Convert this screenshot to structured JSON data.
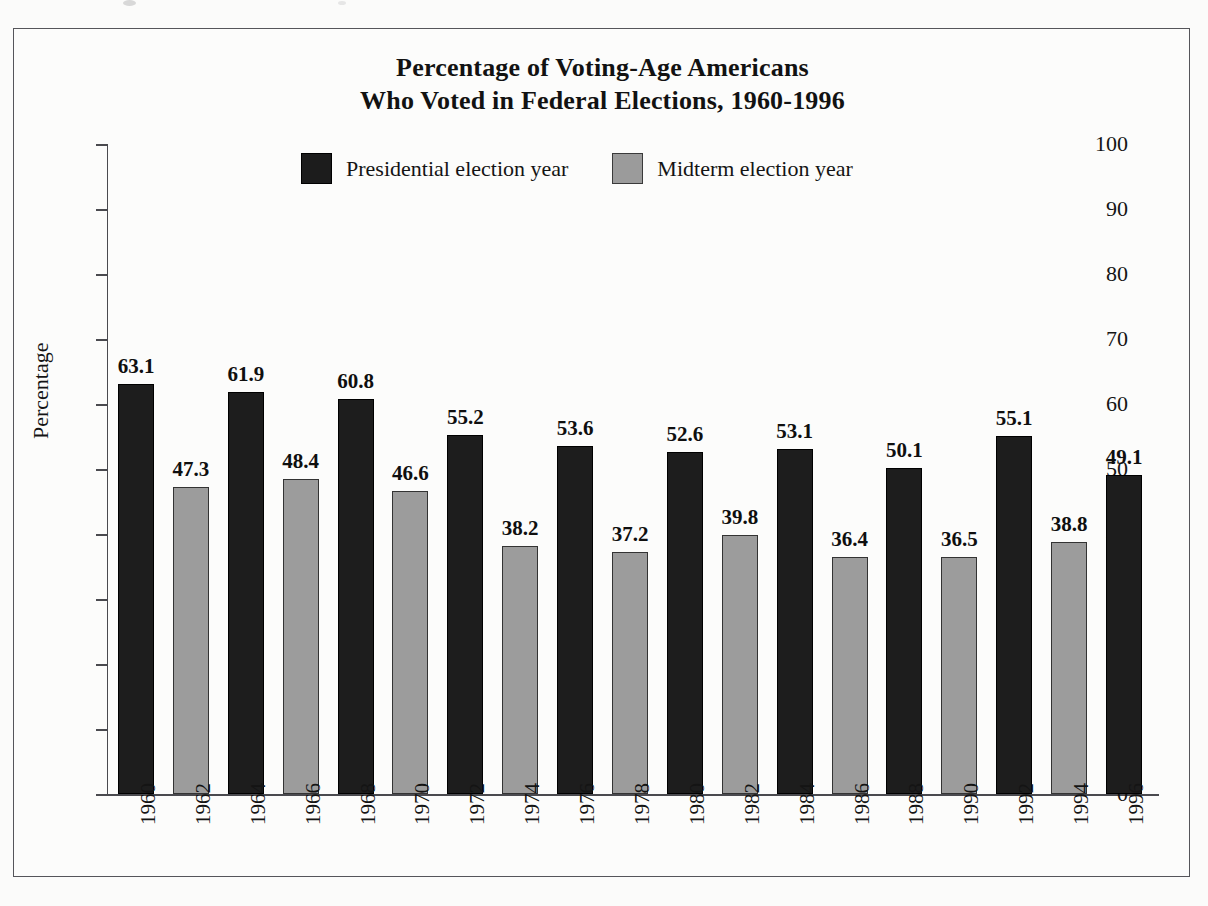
{
  "chart_data": {
    "type": "bar",
    "title": "Percentage of Voting-Age Americans Who Voted in Federal Elections, 1960-1996",
    "title_lines": [
      "Percentage of Voting-Age Americans",
      "Who Voted in Federal Elections, 1960-1996"
    ],
    "xlabel": "",
    "ylabel": "Percentage",
    "ylim": [
      0,
      100
    ],
    "ytick_step": 10,
    "grid": false,
    "legend_position": "top-center",
    "categories": [
      "1960",
      "1962",
      "1964",
      "1966",
      "1968",
      "1970",
      "1972",
      "1974",
      "1976",
      "1978",
      "1980",
      "1982",
      "1984",
      "1986",
      "1988",
      "1990",
      "1992",
      "1994",
      "1996"
    ],
    "values": [
      63.1,
      47.3,
      61.9,
      48.4,
      60.8,
      46.6,
      55.2,
      38.2,
      53.6,
      37.2,
      52.6,
      39.8,
      53.1,
      36.4,
      50.1,
      36.5,
      55.1,
      38.8,
      49.1
    ],
    "value_labels": [
      "63.1",
      "47.3",
      "61.9",
      "48.4",
      "60.8",
      "46.6",
      "55.2",
      "38.2",
      "53.6",
      "37.2",
      "52.6",
      "39.8",
      "53.1",
      "36.4",
      "50.1",
      "36.5",
      "55.1",
      "38.8",
      "49.1"
    ],
    "bar_series": [
      "presidential",
      "midterm",
      "presidential",
      "midterm",
      "presidential",
      "midterm",
      "presidential",
      "midterm",
      "presidential",
      "midterm",
      "presidential",
      "midterm",
      "presidential",
      "midterm",
      "presidential",
      "midterm",
      "presidential",
      "midterm",
      "presidential"
    ],
    "ytick_labels": [
      "100",
      "90",
      "80",
      "70",
      "60",
      "50",
      "40",
      "30",
      "20",
      "10",
      "0"
    ],
    "ytick_values": [
      100,
      90,
      80,
      70,
      60,
      50,
      40,
      30,
      20,
      10,
      0
    ],
    "legend": [
      {
        "key": "presidential",
        "label": "Presidential election year",
        "color": "#1d1d1d"
      },
      {
        "key": "midterm",
        "label": "Midterm election year",
        "color": "#9c9c9c"
      }
    ],
    "colors": {
      "presidential": "#1d1d1d",
      "midterm": "#9c9c9c",
      "axis": "#4a4a4f",
      "frame": "#55555a",
      "text": "#141414",
      "background": "#fbfbfa"
    }
  }
}
